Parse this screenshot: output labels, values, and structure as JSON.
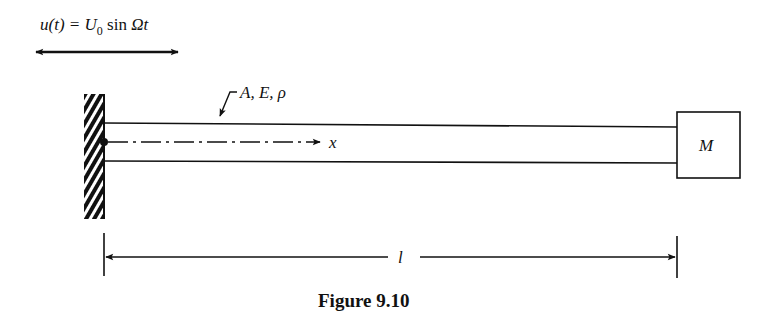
{
  "figure": {
    "caption": "Figure 9.10",
    "excitation": {
      "lhs": "u(t) = U",
      "subscript": "0",
      "rhs_fn": " sin ",
      "rhs_var": "Ωt"
    },
    "beam_properties_label": "A, E, ρ",
    "axis_label": "x",
    "mass_label": "M",
    "length_label": "l"
  },
  "colors": {
    "ink": "#111111",
    "background": "#ffffff"
  }
}
